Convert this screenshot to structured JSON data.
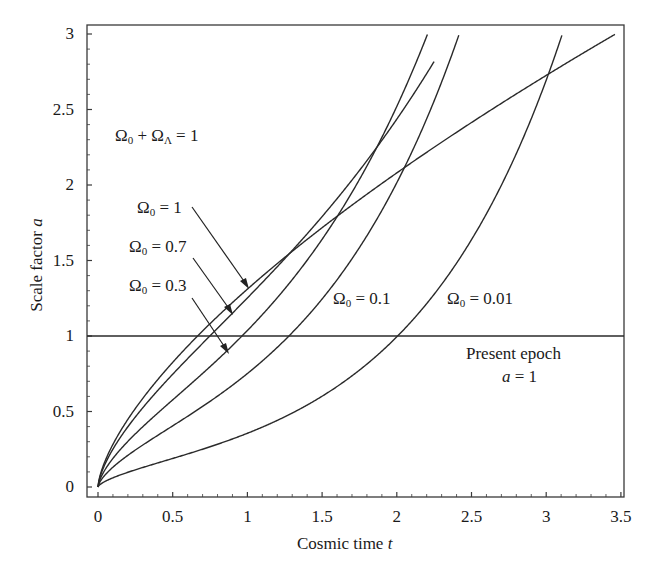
{
  "chart_data": {
    "type": "line",
    "title": "",
    "xlabel": "Cosmic time",
    "xlabel_var": "t",
    "ylabel": "Scale factor",
    "ylabel_var": "a",
    "xlim": [
      0,
      3.5
    ],
    "ylim": [
      0,
      3
    ],
    "grid": false,
    "legend": "none (inline labels with arrows)",
    "x_ticks": [
      "0",
      "0.5",
      "1",
      "1.5",
      "2",
      "2.5",
      "3",
      "3.5"
    ],
    "y_ticks": [
      "0",
      "0.5",
      "1",
      "1.5",
      "2",
      "2.5",
      "3"
    ],
    "reference_line": {
      "y": 1,
      "label": "Present epoch",
      "sublabel": "a = 1"
    },
    "annotation_constraint": "Ω0 + ΩΛ = 1",
    "series": [
      {
        "name": "Ω0 = 1",
        "omega0": 1.0,
        "t": [
          0,
          0.1,
          0.25,
          0.5,
          0.667,
          1.0,
          1.5,
          2.0,
          2.5,
          3.0,
          3.46
        ],
        "a": [
          0,
          0.28,
          0.52,
          0.83,
          1.0,
          1.31,
          1.72,
          2.08,
          2.41,
          2.73,
          3.0
        ]
      },
      {
        "name": "Ω0 = 0.7",
        "omega0": 0.7,
        "t": [
          0,
          0.1,
          0.25,
          0.5,
          0.75,
          0.964,
          1.25,
          1.5,
          1.75,
          2.0,
          2.2
        ],
        "a": [
          0,
          0.26,
          0.49,
          0.8,
          1.07,
          1.32,
          1.68,
          2.02,
          2.41,
          2.85,
          3.0
        ]
      },
      {
        "name": "Ω0 = 0.3",
        "omega0": 0.3,
        "t": [
          0,
          0.1,
          0.25,
          0.5,
          0.75,
          0.964,
          1.25,
          1.5,
          1.75,
          2.0,
          2.2,
          2.4
        ],
        "a": [
          0,
          0.21,
          0.4,
          0.64,
          0.85,
          1.0,
          1.3,
          1.6,
          1.93,
          2.31,
          2.64,
          3.0
        ]
      },
      {
        "name": "Ω0 = 0.1",
        "omega0": 0.1,
        "t": [
          0,
          0.1,
          0.25,
          0.5,
          0.75,
          1.0,
          1.28,
          1.5,
          1.75,
          2.0,
          2.2,
          2.4
        ],
        "a": [
          0,
          0.15,
          0.27,
          0.45,
          0.62,
          0.79,
          1.0,
          1.19,
          1.47,
          1.79,
          2.1,
          2.45
        ]
      },
      {
        "name": "Ω0 = 0.01",
        "omega0": 0.01,
        "t": [
          0,
          0.1,
          0.25,
          0.5,
          0.75,
          1.0,
          1.25,
          1.5,
          1.75,
          2.0,
          2.25,
          2.5,
          2.75,
          3.0,
          3.1
        ],
        "a": [
          0,
          0.07,
          0.13,
          0.21,
          0.29,
          0.36,
          0.45,
          0.58,
          0.76,
          1.0,
          1.32,
          1.72,
          2.23,
          2.84,
          3.0
        ]
      }
    ],
    "model": "a(t) = (Ω0/ΩΛ)^(1/3) · sinh^(2/3)(1.5·√ΩΛ·t); Ω0=1: a = (1.5 t)^(2/3)"
  },
  "labels": {
    "constraint": {
      "base": "Ω",
      "sub1": "0",
      "plus": " + Ω",
      "sub2": "Λ",
      "rest": " = 1"
    },
    "omega1": {
      "base": "Ω",
      "sub": "0",
      "rest": " = 1"
    },
    "omega07": {
      "base": "Ω",
      "sub": "0",
      "rest": " = 0.7"
    },
    "omega03": {
      "base": "Ω",
      "sub": "0",
      "rest": " = 0.3"
    },
    "omega01": {
      "base": "Ω",
      "sub": "0",
      "rest": " = 0.1"
    },
    "omega001": {
      "base": "Ω",
      "sub": "0",
      "rest": " = 0.01"
    },
    "present": "Present epoch",
    "present_a": "a",
    "present_eq": " = 1",
    "xlabel": "Cosmic time ",
    "xvar": "t",
    "ylabel": "Scale factor ",
    "yvar": "a"
  },
  "colors": {
    "line": "#2a2a2a",
    "frame": "#3a3a3a",
    "background": "#ffffff"
  }
}
